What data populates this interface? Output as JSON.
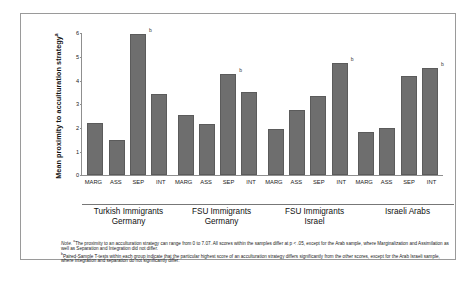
{
  "figure": {
    "ylabel": "Mean proximity to acculturation strategy",
    "ylabel_sup": "a",
    "note_label": "Note.",
    "note_sup_a": "a",
    "note_line_a": "The proximity to an acculturation strategy can range from 0 to 7.07. All scores within the samples differ at p < .05, except for the Arab sample, where Marginalization and Assimilation as well as Separation and Integration did not differ.",
    "note_sup_b": "b",
    "note_line_b": "Paired-Sample T-tests within each group indicate that the particular highest score of an acculturation strategy differs significantly from the other scores, except for the Arab Israeli sample, where integration and separation do not significantly differ."
  },
  "chart_data": {
    "type": "bar",
    "title": "",
    "xlabel": "",
    "ylabel": "Mean proximity to acculturation strategy",
    "ylim": [
      0,
      6
    ],
    "yticks": [
      "0",
      "1",
      "2",
      "3",
      "4",
      "5",
      "6"
    ],
    "grid": false,
    "legend": "none",
    "categories": [
      "MARG",
      "ASS",
      "SEP",
      "INT"
    ],
    "groups": [
      {
        "name": "Turkish Immigrants",
        "name2": "Germany",
        "values": [
          2.2,
          1.5,
          6.0,
          3.45
        ],
        "marks": [
          "",
          "",
          "b",
          ""
        ]
      },
      {
        "name": "FSU Immigrants",
        "name2": "Germany",
        "values": [
          2.55,
          2.15,
          4.3,
          3.55
        ],
        "marks": [
          "",
          "",
          "b",
          ""
        ]
      },
      {
        "name": "FSU Immigrants",
        "name2": "Israel",
        "values": [
          1.95,
          2.75,
          3.35,
          4.75
        ],
        "marks": [
          "",
          "",
          "",
          "b"
        ]
      },
      {
        "name": "Israeli Arabs",
        "name2": "",
        "values": [
          1.85,
          2.0,
          4.2,
          4.55
        ],
        "marks": [
          "",
          "",
          "",
          "b"
        ]
      }
    ]
  },
  "colors": {
    "bar_fill": "#6e6e6e",
    "bar_stroke": "#5b5b5b",
    "axis": "#8f8f8f",
    "frame": "#9a9a9a",
    "background": "#ffffff"
  }
}
